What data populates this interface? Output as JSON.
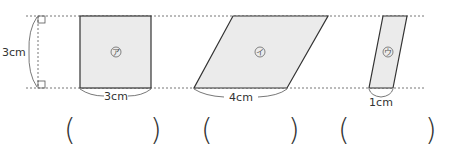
{
  "figure": {
    "height_label": "3cm",
    "shapes": [
      {
        "id": "square",
        "mark": "ア",
        "base_label": "3cm"
      },
      {
        "id": "parallelogram",
        "mark": "イ",
        "base_label": "4cm"
      },
      {
        "id": "strip",
        "mark": "ウ",
        "base_label": "1cm"
      }
    ],
    "answers": [
      {
        "open": "(",
        "close": ")",
        "value": ""
      },
      {
        "open": "(",
        "close": ")",
        "value": ""
      },
      {
        "open": "(",
        "close": ")",
        "value": ""
      }
    ],
    "colors": {
      "fill": "#ebebeb",
      "stroke": "#333333",
      "dotted": "#777777"
    }
  }
}
